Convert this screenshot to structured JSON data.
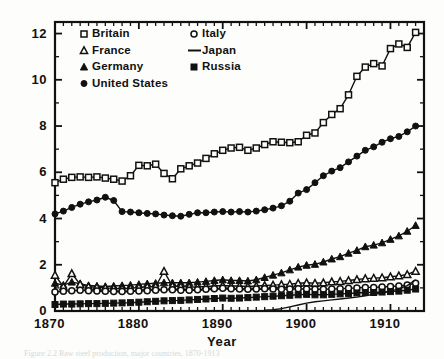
{
  "figure": {
    "caption": "Figure 2.2   Raw steel production, major countries, 1870-1913",
    "background": "#fdfdfb",
    "ink": "#111111"
  },
  "chart_data": {
    "type": "line",
    "title": "",
    "xlabel": "Year",
    "ylabel": "Millions of Net Tons",
    "xlim": [
      1870,
      1914
    ],
    "ylim": [
      0,
      12.5
    ],
    "grid": false,
    "legend_position": "top-left-inside",
    "xticks_major": [
      1870,
      1880,
      1890,
      1900,
      1910
    ],
    "xticks_major_labels": [
      "1870",
      "1880",
      "1890",
      "1900",
      "1910"
    ],
    "xtick_minor_step": 1,
    "yticks_major": [
      0,
      2,
      4,
      6,
      8,
      10,
      12
    ],
    "yticks_major_labels": [
      "0",
      "2",
      "4",
      "6",
      "8",
      "10",
      "12"
    ],
    "ytick_minor_step": 1,
    "ticks_all_sides": true,
    "tick_direction": "in",
    "series": [
      {
        "name": "Britain",
        "marker": "open-square",
        "x": [
          1870,
          1871,
          1872,
          1873,
          1874,
          1875,
          1876,
          1877,
          1878,
          1879,
          1880,
          1881,
          1882,
          1883,
          1884,
          1885,
          1886,
          1887,
          1888,
          1889,
          1890,
          1891,
          1892,
          1893,
          1894,
          1895,
          1896,
          1897,
          1898,
          1899,
          1900,
          1901,
          1902,
          1903,
          1904,
          1905,
          1906,
          1907,
          1908,
          1909,
          1910,
          1911,
          1912,
          1913
        ],
        "y": [
          5.55,
          5.7,
          5.78,
          5.8,
          5.78,
          5.8,
          5.75,
          5.7,
          5.62,
          5.85,
          6.3,
          6.28,
          6.35,
          5.95,
          5.72,
          6.15,
          6.28,
          6.4,
          6.6,
          6.8,
          6.95,
          7.05,
          7.08,
          6.95,
          7.05,
          7.2,
          7.32,
          7.3,
          7.28,
          7.32,
          7.6,
          7.7,
          8.15,
          8.5,
          8.75,
          9.35,
          10.15,
          10.55,
          10.7,
          10.6,
          11.35,
          11.55,
          11.4,
          12.05
        ]
      },
      {
        "name": "United States",
        "marker": "filled-circle",
        "x": [
          1870,
          1871,
          1872,
          1873,
          1874,
          1875,
          1876,
          1877,
          1878,
          1879,
          1880,
          1881,
          1882,
          1883,
          1884,
          1885,
          1886,
          1887,
          1888,
          1889,
          1890,
          1891,
          1892,
          1893,
          1894,
          1895,
          1896,
          1897,
          1898,
          1899,
          1900,
          1901,
          1902,
          1903,
          1904,
          1905,
          1906,
          1907,
          1908,
          1909,
          1910,
          1911,
          1912,
          1913
        ],
        "y": [
          4.2,
          4.32,
          4.48,
          4.62,
          4.72,
          4.8,
          4.92,
          4.78,
          4.3,
          4.28,
          4.25,
          4.22,
          4.2,
          4.15,
          4.12,
          4.1,
          4.18,
          4.25,
          4.25,
          4.28,
          4.3,
          4.28,
          4.3,
          4.28,
          4.32,
          4.38,
          4.45,
          4.55,
          4.75,
          5.1,
          5.25,
          5.55,
          5.85,
          6.05,
          6.2,
          6.45,
          6.7,
          6.95,
          7.1,
          7.3,
          7.45,
          7.55,
          7.75,
          8.0
        ]
      },
      {
        "name": "Germany",
        "marker": "filled-triangle",
        "x": [
          1870,
          1871,
          1872,
          1873,
          1874,
          1875,
          1876,
          1877,
          1878,
          1879,
          1880,
          1881,
          1882,
          1883,
          1884,
          1885,
          1886,
          1887,
          1888,
          1889,
          1890,
          1891,
          1892,
          1893,
          1894,
          1895,
          1896,
          1897,
          1898,
          1899,
          1900,
          1901,
          1902,
          1903,
          1904,
          1905,
          1906,
          1907,
          1908,
          1909,
          1910,
          1911,
          1912,
          1913
        ],
        "y": [
          1.2,
          1.12,
          1.25,
          1.18,
          1.1,
          1.08,
          1.06,
          1.08,
          1.1,
          1.12,
          1.15,
          1.18,
          1.2,
          1.22,
          1.22,
          1.22,
          1.22,
          1.25,
          1.28,
          1.32,
          1.35,
          1.32,
          1.32,
          1.3,
          1.35,
          1.45,
          1.55,
          1.65,
          1.78,
          1.9,
          1.98,
          2.02,
          2.12,
          2.25,
          2.35,
          2.5,
          2.62,
          2.78,
          2.85,
          2.95,
          3.1,
          3.25,
          3.45,
          3.7
        ]
      },
      {
        "name": "France",
        "marker": "open-triangle",
        "x": [
          1870,
          1871,
          1872,
          1873,
          1874,
          1875,
          1876,
          1877,
          1878,
          1879,
          1880,
          1881,
          1882,
          1883,
          1884,
          1885,
          1886,
          1887,
          1888,
          1889,
          1890,
          1891,
          1892,
          1893,
          1894,
          1895,
          1896,
          1897,
          1898,
          1899,
          1900,
          1901,
          1902,
          1903,
          1904,
          1905,
          1906,
          1907,
          1908,
          1909,
          1910,
          1911,
          1912,
          1913
        ],
        "y": [
          1.55,
          1.05,
          1.62,
          1.15,
          1.05,
          1.02,
          1.0,
          0.98,
          0.96,
          0.98,
          1.02,
          1.04,
          1.06,
          1.72,
          1.08,
          1.06,
          1.04,
          1.04,
          1.06,
          1.08,
          1.1,
          1.08,
          1.08,
          1.06,
          1.08,
          1.1,
          1.12,
          1.14,
          1.16,
          1.2,
          1.22,
          1.2,
          1.22,
          1.26,
          1.28,
          1.32,
          1.36,
          1.4,
          1.42,
          1.44,
          1.48,
          1.52,
          1.58,
          1.72
        ]
      },
      {
        "name": "Italy",
        "marker": "open-circle",
        "x": [
          1870,
          1871,
          1872,
          1873,
          1874,
          1875,
          1876,
          1877,
          1878,
          1879,
          1880,
          1881,
          1882,
          1883,
          1884,
          1885,
          1886,
          1887,
          1888,
          1889,
          1890,
          1891,
          1892,
          1893,
          1894,
          1895,
          1896,
          1897,
          1898,
          1899,
          1900,
          1901,
          1902,
          1903,
          1904,
          1905,
          1906,
          1907,
          1908,
          1909,
          1910,
          1911,
          1912,
          1913
        ],
        "y": [
          0.82,
          0.85,
          0.88,
          0.9,
          0.88,
          0.86,
          0.85,
          0.84,
          0.84,
          0.85,
          0.86,
          0.88,
          0.9,
          0.92,
          0.92,
          0.9,
          0.9,
          0.92,
          0.94,
          0.96,
          0.98,
          0.96,
          0.95,
          0.94,
          0.95,
          0.96,
          0.95,
          0.94,
          0.95,
          0.96,
          0.95,
          0.94,
          0.94,
          0.95,
          0.96,
          0.98,
          1.0,
          1.02,
          1.02,
          1.04,
          1.06,
          1.08,
          1.12,
          1.2
        ]
      },
      {
        "name": "Russia",
        "marker": "filled-square",
        "x": [
          1870,
          1871,
          1872,
          1873,
          1874,
          1875,
          1876,
          1877,
          1878,
          1879,
          1880,
          1881,
          1882,
          1883,
          1884,
          1885,
          1886,
          1887,
          1888,
          1889,
          1890,
          1891,
          1892,
          1893,
          1894,
          1895,
          1896,
          1897,
          1898,
          1899,
          1900,
          1901,
          1902,
          1903,
          1904,
          1905,
          1906,
          1907,
          1908,
          1909,
          1910,
          1911,
          1912,
          1913
        ],
        "y": [
          0.28,
          0.3,
          0.3,
          0.31,
          0.32,
          0.32,
          0.33,
          0.34,
          0.35,
          0.36,
          0.38,
          0.4,
          0.42,
          0.44,
          0.45,
          0.46,
          0.48,
          0.5,
          0.52,
          0.54,
          0.56,
          0.55,
          0.56,
          0.58,
          0.6,
          0.62,
          0.64,
          0.66,
          0.68,
          0.7,
          0.72,
          0.7,
          0.7,
          0.72,
          0.74,
          0.76,
          0.78,
          0.8,
          0.8,
          0.82,
          0.84,
          0.86,
          0.9,
          0.95
        ]
      },
      {
        "name": "Japan",
        "marker": "line",
        "x": [
          1895,
          1896,
          1897,
          1898,
          1899,
          1900,
          1901,
          1902,
          1903,
          1904,
          1905,
          1906,
          1907,
          1908,
          1909,
          1910,
          1911,
          1912,
          1913
        ],
        "y": [
          0.04,
          0.06,
          0.1,
          0.18,
          0.26,
          0.34,
          0.4,
          0.44,
          0.48,
          0.52,
          0.56,
          0.6,
          0.66,
          0.72,
          0.78,
          0.86,
          0.96,
          1.1,
          1.35
        ]
      }
    ]
  },
  "legend": {
    "entries": [
      {
        "label": "Britain",
        "marker": "open-square",
        "col": 0,
        "row": 0
      },
      {
        "label": "Italy",
        "marker": "open-circle",
        "col": 1,
        "row": 0
      },
      {
        "label": "France",
        "marker": "open-triangle",
        "col": 0,
        "row": 1
      },
      {
        "label": "Japan",
        "marker": "line",
        "col": 1,
        "row": 1
      },
      {
        "label": "Germany",
        "marker": "filled-triangle",
        "col": 0,
        "row": 2
      },
      {
        "label": "Russia",
        "marker": "filled-square",
        "col": 1,
        "row": 2
      },
      {
        "label": "United States",
        "marker": "filled-circle",
        "col": 0,
        "row": 3
      }
    ]
  }
}
